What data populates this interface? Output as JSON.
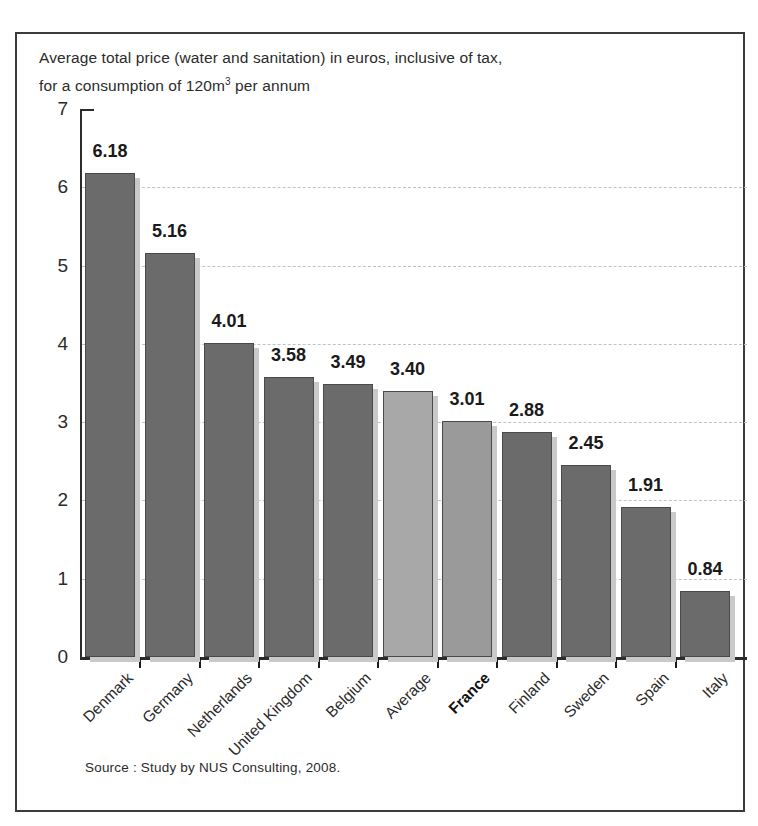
{
  "figure": {
    "border_color": "#3b3b3b",
    "background": "#ffffff"
  },
  "title": {
    "line1": "Average total price (water and sanitation) in euros, inclusive of tax,",
    "line2_before": "for a consumption of 120m",
    "line2_sup": "3",
    "line2_after": " per annum"
  },
  "source": {
    "text": "Source : Study by NUS Consulting, 2008."
  },
  "colors": {
    "bar_default": "#6b6b6b",
    "bar_average": "#a8a8a8",
    "bar_france": "#9a9a9a",
    "bar_shadow": "#c9c9c9",
    "bar_outline": "#4a4a4a",
    "axis": "#2b2b2b",
    "gridline": "#b9c4cc",
    "text": "#2b2b2b"
  },
  "chart_data": {
    "type": "bar",
    "subtitle": "",
    "xlabel": "",
    "ylabel": "",
    "ylim": [
      0,
      7
    ],
    "yticks": [
      0,
      1,
      2,
      3,
      4,
      5,
      6,
      7
    ],
    "ytick_labels": [
      "0",
      "1",
      "2",
      "3",
      "4",
      "5",
      "6",
      "7"
    ],
    "grid": true,
    "grid_axis": "y",
    "legend": false,
    "legend_position": "none",
    "source": "Source : Study by NUS Consulting, 2008.",
    "units": "euros per m3 (inclusive of tax)",
    "categories": [
      "Denmark",
      "Germany",
      "Netherlands",
      "United Kingdom",
      "Belgium",
      "Average",
      "France",
      "Finland",
      "Sweden",
      "Spain",
      "Italy"
    ],
    "values": [
      6.18,
      5.16,
      4.01,
      3.58,
      3.49,
      3.4,
      3.01,
      2.88,
      2.45,
      1.91,
      0.84
    ],
    "value_labels": [
      "6.18",
      "5.16",
      "4.01",
      "3.58",
      "3.49",
      "3.40",
      "3.01",
      "2.88",
      "2.45",
      "1.91",
      "0.84"
    ],
    "bar_colors": [
      "#6b6b6b",
      "#6b6b6b",
      "#6b6b6b",
      "#6b6b6b",
      "#6b6b6b",
      "#a8a8a8",
      "#9a9a9a",
      "#6b6b6b",
      "#6b6b6b",
      "#6b6b6b",
      "#6b6b6b"
    ],
    "highlighted_categories": [
      "France"
    ],
    "bold_tick_labels": [
      "France"
    ]
  }
}
